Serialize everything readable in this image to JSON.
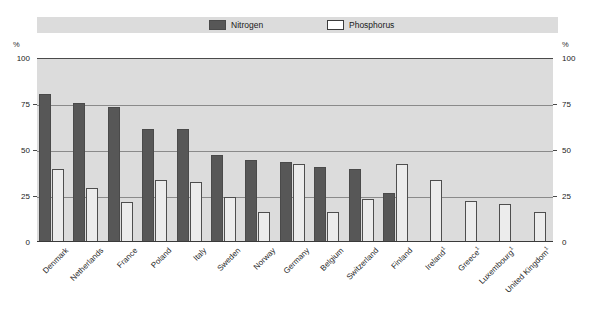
{
  "legend": {
    "items": [
      {
        "label": "Nitrogen",
        "icon": "filled-square-swatch",
        "color": "#575757"
      },
      {
        "label": "Phosphorus",
        "icon": "outlined-square-swatch",
        "color": "#ffffff"
      }
    ]
  },
  "axes": {
    "left_unit": "%",
    "right_unit": "%",
    "ticks": [
      "100",
      "75",
      "50",
      "25",
      "0"
    ]
  },
  "footnote_marker": "1",
  "chart_data": {
    "type": "bar",
    "title": "",
    "subtitle": "",
    "xlabel": "",
    "ylabel": "%",
    "ylim": [
      0,
      100
    ],
    "yticks": [
      0,
      25,
      50,
      75,
      100
    ],
    "grid": true,
    "legend_position": "top",
    "categories": [
      "Denmark",
      "Netherlands",
      "France",
      "Poland",
      "Italy",
      "Sweden",
      "Norway",
      "Germany",
      "Belgium",
      "Switzerland",
      "Finland",
      "Ireland¹",
      "Greece¹",
      "Luxembourg¹",
      "United Kingdom¹"
    ],
    "series": [
      {
        "name": "Nitrogen",
        "color": "#575757",
        "values": [
          80,
          75,
          73,
          61,
          61,
          47,
          44,
          43,
          40,
          39,
          26,
          null,
          null,
          null,
          null
        ]
      },
      {
        "name": "Phosphorus",
        "color": "#ececec",
        "values": [
          39,
          29,
          21,
          33,
          32,
          24,
          16,
          42,
          16,
          23,
          42,
          33,
          22,
          20,
          16
        ]
      }
    ]
  }
}
